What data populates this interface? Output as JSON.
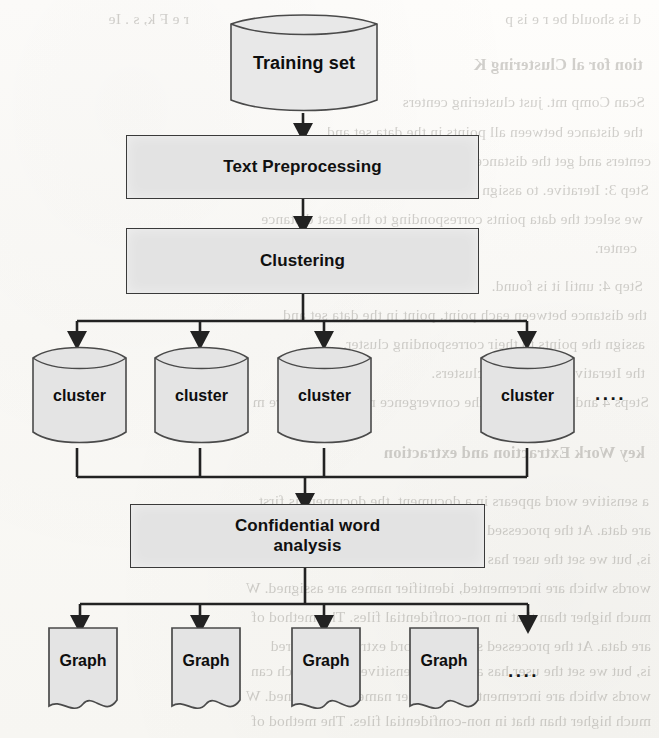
{
  "page": {
    "width": 659,
    "height": 738,
    "background_color": "#fdfcfa",
    "ink_color": "#222222",
    "shape_fill": "#e3e3e3",
    "shape_stroke": "#3a3a3a"
  },
  "diagram": {
    "type": "flowchart",
    "title": "",
    "nodes": [
      {
        "id": "training-set",
        "label": "Training set",
        "shape": "cylinder"
      },
      {
        "id": "text-preprocessing",
        "label": "Text Preprocessing",
        "shape": "process"
      },
      {
        "id": "clustering",
        "label": "Clustering",
        "shape": "process"
      },
      {
        "id": "cluster-1",
        "label": "cluster",
        "shape": "cylinder"
      },
      {
        "id": "cluster-2",
        "label": "cluster",
        "shape": "cylinder"
      },
      {
        "id": "cluster-3",
        "label": "cluster",
        "shape": "cylinder"
      },
      {
        "id": "cluster-4",
        "label": "cluster",
        "shape": "cylinder"
      },
      {
        "id": "cluster-more",
        "label": "....",
        "shape": "ellipsis"
      },
      {
        "id": "confidential-word-analysis",
        "label_line1": "Confidential word",
        "label_line2": "analysis",
        "shape": "process"
      },
      {
        "id": "graph-1",
        "label": "Graph",
        "shape": "document"
      },
      {
        "id": "graph-2",
        "label": "Graph",
        "shape": "document"
      },
      {
        "id": "graph-3",
        "label": "Graph",
        "shape": "document"
      },
      {
        "id": "graph-4",
        "label": "Graph",
        "shape": "document"
      },
      {
        "id": "graph-more",
        "label": "....",
        "shape": "ellipsis"
      }
    ],
    "edges": [
      {
        "from": "training-set",
        "to": "text-preprocessing",
        "style": "arrow"
      },
      {
        "from": "text-preprocessing",
        "to": "clustering",
        "style": "arrow"
      },
      {
        "from": "clustering",
        "to": "cluster-1",
        "style": "arrow-fan"
      },
      {
        "from": "clustering",
        "to": "cluster-2",
        "style": "arrow-fan"
      },
      {
        "from": "clustering",
        "to": "cluster-3",
        "style": "arrow-fan"
      },
      {
        "from": "clustering",
        "to": "cluster-4",
        "style": "arrow-fan"
      },
      {
        "from": "cluster-1",
        "to": "confidential-word-analysis",
        "style": "merge"
      },
      {
        "from": "cluster-2",
        "to": "confidential-word-analysis",
        "style": "merge"
      },
      {
        "from": "cluster-3",
        "to": "confidential-word-analysis",
        "style": "merge"
      },
      {
        "from": "cluster-4",
        "to": "confidential-word-analysis",
        "style": "merge"
      },
      {
        "from": "confidential-word-analysis",
        "to": "graph-1",
        "style": "arrow-fan"
      },
      {
        "from": "confidential-word-analysis",
        "to": "graph-2",
        "style": "arrow-fan"
      },
      {
        "from": "confidential-word-analysis",
        "to": "graph-3",
        "style": "arrow-fan"
      },
      {
        "from": "confidential-word-analysis",
        "to": "graph-4",
        "style": "arrow-fan"
      }
    ]
  },
  "labels": {
    "training_set": "Training set",
    "text_preprocessing": "Text Preprocessing",
    "clustering": "Clustering",
    "cluster": "cluster",
    "confidential_line1": "Confidential word",
    "confidential_line2": "analysis",
    "graph": "Graph",
    "ellipsis": "...."
  },
  "bleed_text": {
    "description": "faint mirrored show-through text from the reverse side of the scanned page",
    "lines": [
      {
        "text": "d is should be  r e  is p",
        "x": 18,
        "y": 10
      },
      {
        "text": "r e  F k, s  . Ie",
        "x": 470,
        "y": 10
      },
      {
        "text": "tion for al Clustering K",
        "x": 16,
        "y": 55
      },
      {
        "text": "Scan  Comp  mt. just clustering centers",
        "x": 14,
        "y": 93
      },
      {
        "text": "the distance between all points in the data set and",
        "x": 16,
        "y": 123
      },
      {
        "text": "centers and get the distance set d = {d1, d2, ... , dk}, where de",
        "x": 8,
        "y": 152
      },
      {
        "text": "Step 3: Iterative. to assign tasks we do for each cluster the near",
        "x": 10,
        "y": 181
      },
      {
        "text": "we select the data points corresponding to the least distance",
        "x": 16,
        "y": 210
      },
      {
        "text": "center.",
        "x": 22,
        "y": 239
      },
      {
        "text": "Step 4: until it is found.",
        "x": 16,
        "y": 277
      },
      {
        "text": "the distance between each point, point in the data set and",
        "x": 12,
        "y": 306
      },
      {
        "text": "assign the points to their corresponding cluster.",
        "x": 14,
        "y": 335
      },
      {
        "text": "the Iterative process. the clusters.",
        "x": 14,
        "y": 364
      },
      {
        "text": "Steps 4 and 5 above until the convergence requirements are m",
        "x": 10,
        "y": 393
      },
      {
        "text": "key Work Extraction and extraction",
        "x": 14,
        "y": 443
      },
      {
        "text": "a sensitive word appears in a document, the document is first",
        "x": 10,
        "y": 492
      },
      {
        "text": "are data. At the processed sensitive word extraction and red",
        "x": 8,
        "y": 521
      },
      {
        "text": "is, but we set the user has a selected sensitive word, which can",
        "x": 8,
        "y": 550
      },
      {
        "text": "words  which are incremented, identifier names are assigned. W",
        "x": 8,
        "y": 579
      },
      {
        "text": "much higher than that in non-confidential files. The method of",
        "x": 8,
        "y": 608
      },
      {
        "text": "are data. At the processed sensitive word extraction and red",
        "x": 8,
        "y": 637
      },
      {
        "text": "is, but we set the user has a selected sensitive word, which can",
        "x": 8,
        "y": 662
      },
      {
        "text": "words  which are incremented, identifier names are assigned. W",
        "x": 8,
        "y": 687
      },
      {
        "text": "much higher than that in non-confidential files. The method of",
        "x": 8,
        "y": 712
      }
    ]
  }
}
